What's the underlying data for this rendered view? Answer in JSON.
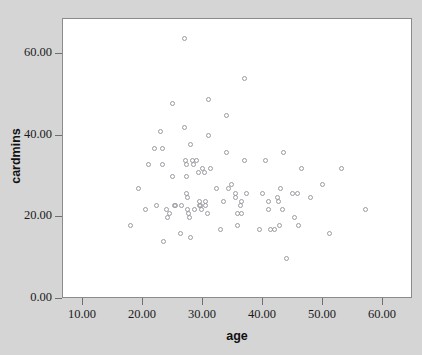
{
  "chart_data": {
    "type": "scatter",
    "title": "",
    "xlabel": "age",
    "ylabel": "cardmins",
    "xlim": [
      6.67,
      65.0
    ],
    "ylim": [
      0.0,
      68.7
    ],
    "grid": false,
    "legend": "none",
    "marker": "open-circle",
    "marker_color": "#9a9aa2",
    "xticks": [
      10,
      20,
      30,
      40,
      50,
      60
    ],
    "xtick_labels": [
      "10.00",
      "20.00",
      "30.00",
      "40.00",
      "50.00",
      "60.00"
    ],
    "yticks": [
      0,
      20,
      40,
      60
    ],
    "ytick_labels": [
      "0.00",
      "20.00",
      "40.00",
      "60.00"
    ],
    "series": [
      {
        "name": "cardmins vs age",
        "points": [
          [
            18.0,
            18.0
          ],
          [
            19.2,
            27.0
          ],
          [
            20.5,
            22.0
          ],
          [
            21.0,
            33.0
          ],
          [
            22.0,
            37.0
          ],
          [
            22.2,
            23.0
          ],
          [
            23.0,
            41.0
          ],
          [
            23.2,
            37.0
          ],
          [
            23.3,
            33.0
          ],
          [
            23.4,
            14.0
          ],
          [
            24.0,
            22.0
          ],
          [
            24.1,
            20.0
          ],
          [
            24.4,
            21.0
          ],
          [
            25.0,
            48.0
          ],
          [
            25.0,
            30.0
          ],
          [
            25.2,
            23.0
          ],
          [
            25.5,
            23.0
          ],
          [
            26.2,
            16.0
          ],
          [
            26.5,
            23.0
          ],
          [
            27.0,
            64.0
          ],
          [
            27.0,
            42.0
          ],
          [
            27.1,
            34.0
          ],
          [
            27.2,
            33.0
          ],
          [
            27.2,
            30.0
          ],
          [
            27.3,
            26.0
          ],
          [
            27.4,
            25.0
          ],
          [
            27.5,
            22.0
          ],
          [
            27.6,
            21.0
          ],
          [
            27.7,
            20.0
          ],
          [
            27.9,
            15.0
          ],
          [
            28.0,
            38.0
          ],
          [
            28.2,
            34.0
          ],
          [
            28.4,
            33.0
          ],
          [
            28.6,
            22.0
          ],
          [
            29.0,
            34.0
          ],
          [
            29.2,
            31.0
          ],
          [
            29.4,
            23.0
          ],
          [
            29.5,
            24.0
          ],
          [
            29.6,
            23.0
          ],
          [
            29.7,
            22.0
          ],
          [
            30.0,
            32.0
          ],
          [
            30.2,
            31.0
          ],
          [
            30.4,
            23.0
          ],
          [
            30.5,
            24.0
          ],
          [
            30.7,
            21.0
          ],
          [
            31.0,
            49.0
          ],
          [
            31.0,
            40.0
          ],
          [
            31.2,
            32.0
          ],
          [
            32.3,
            27.0
          ],
          [
            33.0,
            17.0
          ],
          [
            33.5,
            24.0
          ],
          [
            34.0,
            45.0
          ],
          [
            34.0,
            36.0
          ],
          [
            34.2,
            27.0
          ],
          [
            34.8,
            28.0
          ],
          [
            35.4,
            26.0
          ],
          [
            35.5,
            25.0
          ],
          [
            35.7,
            21.0
          ],
          [
            35.8,
            18.0
          ],
          [
            36.3,
            23.0
          ],
          [
            36.4,
            24.0
          ],
          [
            36.5,
            21.0
          ],
          [
            37.0,
            54.0
          ],
          [
            37.0,
            34.0
          ],
          [
            37.2,
            26.0
          ],
          [
            39.5,
            17.0
          ],
          [
            40.0,
            26.0
          ],
          [
            40.5,
            34.0
          ],
          [
            41.0,
            24.0
          ],
          [
            41.0,
            22.0
          ],
          [
            41.2,
            17.0
          ],
          [
            42.0,
            17.0
          ],
          [
            42.5,
            25.0
          ],
          [
            42.6,
            24.0
          ],
          [
            42.8,
            18.0
          ],
          [
            43.0,
            27.0
          ],
          [
            43.2,
            22.0
          ],
          [
            43.5,
            36.0
          ],
          [
            44.0,
            10.0
          ],
          [
            45.0,
            26.0
          ],
          [
            45.3,
            20.0
          ],
          [
            45.8,
            26.0
          ],
          [
            46.0,
            18.0
          ],
          [
            46.5,
            32.0
          ],
          [
            48.0,
            25.0
          ],
          [
            50.0,
            28.0
          ],
          [
            51.0,
            16.0
          ],
          [
            53.0,
            32.0
          ],
          [
            57.0,
            22.0
          ]
        ]
      }
    ]
  },
  "axes": {
    "x_title": "age",
    "y_title": "cardmins"
  }
}
